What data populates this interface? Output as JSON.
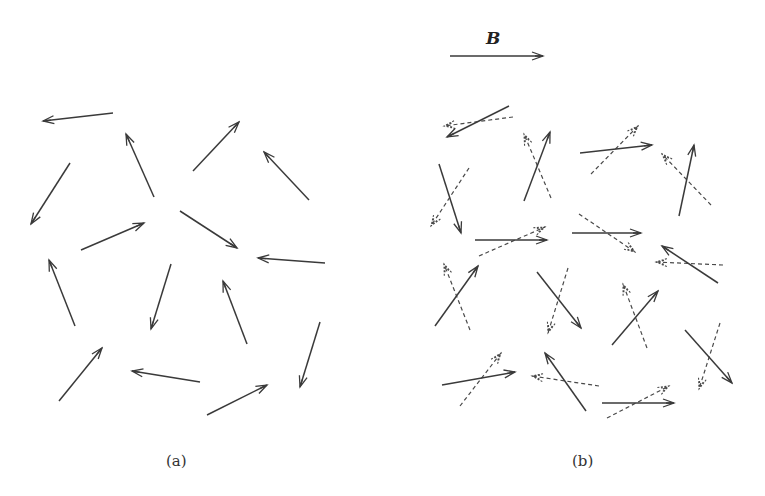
{
  "panels": [
    {
      "id": "a",
      "caption": "(a)",
      "description": "Randomly oriented magnetic dipoles with no applied field",
      "arrows": [
        {
          "x1": 113,
          "y1": 113,
          "x2": 43,
          "y2": 121
        },
        {
          "x1": 154,
          "y1": 197,
          "x2": 126,
          "y2": 134
        },
        {
          "x1": 193,
          "y1": 171,
          "x2": 239,
          "y2": 122
        },
        {
          "x1": 309,
          "y1": 200,
          "x2": 264,
          "y2": 152
        },
        {
          "x1": 70,
          "y1": 163,
          "x2": 31,
          "y2": 224
        },
        {
          "x1": 81,
          "y1": 250,
          "x2": 144,
          "y2": 223
        },
        {
          "x1": 180,
          "y1": 211,
          "x2": 237,
          "y2": 248
        },
        {
          "x1": 325,
          "y1": 263,
          "x2": 258,
          "y2": 258
        },
        {
          "x1": 75,
          "y1": 326,
          "x2": 49,
          "y2": 260
        },
        {
          "x1": 171,
          "y1": 264,
          "x2": 151,
          "y2": 329
        },
        {
          "x1": 247,
          "y1": 344,
          "x2": 223,
          "y2": 281
        },
        {
          "x1": 320,
          "y1": 322,
          "x2": 300,
          "y2": 387
        },
        {
          "x1": 59,
          "y1": 401,
          "x2": 102,
          "y2": 348
        },
        {
          "x1": 200,
          "y1": 382,
          "x2": 132,
          "y2": 371
        },
        {
          "x1": 207,
          "y1": 415,
          "x2": 267,
          "y2": 385
        }
      ]
    },
    {
      "id": "b",
      "caption": "(b)",
      "description": "Dipoles partially aligned toward applied field B; dashed arrows show original orientation",
      "field_label": "B",
      "field_arrow": {
        "x1": 450,
        "y1": 56,
        "x2": 543,
        "y2": 56
      },
      "arrow_pairs": [
        {
          "solid": {
            "x1": 509,
            "y1": 106,
            "x2": 447,
            "y2": 137
          },
          "dashed": {
            "x1": 513,
            "y1": 117,
            "x2": 444,
            "y2": 126
          }
        },
        {
          "solid": {
            "x1": 524,
            "y1": 201,
            "x2": 550,
            "y2": 132
          },
          "dashed": {
            "x1": 551,
            "y1": 198,
            "x2": 524,
            "y2": 134
          }
        },
        {
          "solid": {
            "x1": 580,
            "y1": 153,
            "x2": 652,
            "y2": 145
          },
          "dashed": {
            "x1": 591,
            "y1": 174,
            "x2": 638,
            "y2": 126
          }
        },
        {
          "solid": {
            "x1": 679,
            "y1": 216,
            "x2": 694,
            "y2": 145
          },
          "dashed": {
            "x1": 711,
            "y1": 205,
            "x2": 662,
            "y2": 154
          }
        },
        {
          "solid": {
            "x1": 439,
            "y1": 164,
            "x2": 461,
            "y2": 233
          },
          "dashed": {
            "x1": 469,
            "y1": 168,
            "x2": 431,
            "y2": 226
          }
        },
        {
          "solid": {
            "x1": 475,
            "y1": 240,
            "x2": 547,
            "y2": 240
          },
          "dashed": {
            "x1": 479,
            "y1": 256,
            "x2": 545,
            "y2": 227
          }
        },
        {
          "solid": {
            "x1": 572,
            "y1": 233,
            "x2": 641,
            "y2": 233
          },
          "dashed": {
            "x1": 579,
            "y1": 214,
            "x2": 635,
            "y2": 252
          }
        },
        {
          "solid": {
            "x1": 718,
            "y1": 283,
            "x2": 662,
            "y2": 246
          },
          "dashed": {
            "x1": 723,
            "y1": 265,
            "x2": 656,
            "y2": 262
          }
        },
        {
          "solid": {
            "x1": 435,
            "y1": 326,
            "x2": 478,
            "y2": 266
          },
          "dashed": {
            "x1": 470,
            "y1": 330,
            "x2": 444,
            "y2": 264
          }
        },
        {
          "solid": {
            "x1": 537,
            "y1": 272,
            "x2": 581,
            "y2": 328
          },
          "dashed": {
            "x1": 568,
            "y1": 268,
            "x2": 548,
            "y2": 333
          }
        },
        {
          "solid": {
            "x1": 612,
            "y1": 345,
            "x2": 658,
            "y2": 291
          },
          "dashed": {
            "x1": 647,
            "y1": 348,
            "x2": 623,
            "y2": 284
          }
        },
        {
          "solid": {
            "x1": 685,
            "y1": 330,
            "x2": 732,
            "y2": 383
          },
          "dashed": {
            "x1": 720,
            "y1": 323,
            "x2": 699,
            "y2": 389
          }
        },
        {
          "solid": {
            "x1": 442,
            "y1": 385,
            "x2": 515,
            "y2": 372
          },
          "dashed": {
            "x1": 460,
            "y1": 406,
            "x2": 501,
            "y2": 353
          }
        },
        {
          "solid": {
            "x1": 586,
            "y1": 411,
            "x2": 545,
            "y2": 353
          },
          "dashed": {
            "x1": 599,
            "y1": 386,
            "x2": 532,
            "y2": 376
          }
        },
        {
          "solid": {
            "x1": 602,
            "y1": 403,
            "x2": 674,
            "y2": 403
          },
          "dashed": {
            "x1": 607,
            "y1": 418,
            "x2": 669,
            "y2": 386
          }
        }
      ]
    }
  ],
  "colors": {
    "solid": "#3a3a3a",
    "dashed": "#4a4a4a",
    "background": "#ffffff"
  }
}
